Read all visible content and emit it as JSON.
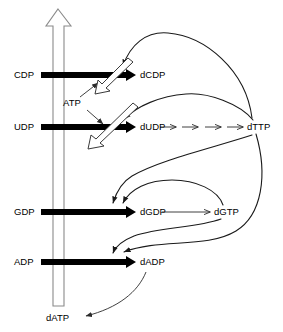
{
  "figure": {
    "type": "pathway-diagram"
  },
  "nodes": {
    "cdp": {
      "label": "CDP",
      "x": 14,
      "y": 75
    },
    "udp": {
      "label": "UDP",
      "x": 14,
      "y": 127
    },
    "gdp": {
      "label": "GDP",
      "x": 14,
      "y": 212
    },
    "adp": {
      "label": "ADP",
      "x": 14,
      "y": 262
    },
    "dcdp": {
      "label": "dCDP",
      "x": 140,
      "y": 75
    },
    "dudp": {
      "label": "dUDP",
      "x": 140,
      "y": 127
    },
    "dgdp": {
      "label": "dGDP",
      "x": 140,
      "y": 212
    },
    "dadp": {
      "label": "dADP",
      "x": 140,
      "y": 262
    },
    "dttp": {
      "label": "dTTP",
      "x": 255,
      "y": 127
    },
    "dgtp": {
      "label": "dGTP",
      "x": 222,
      "y": 212
    },
    "datp": {
      "label": "dATP",
      "x": 60,
      "y": 318
    },
    "atp": {
      "label": "ATP",
      "x": 83,
      "y": 103
    }
  },
  "reactions": [
    {
      "name": "cdp-to-dcdp",
      "from": "CDP",
      "to": "dCDP",
      "style": "thick-arrow"
    },
    {
      "name": "udp-to-dudp",
      "from": "UDP",
      "to": "dUDP",
      "style": "thick-arrow"
    },
    {
      "name": "gdp-to-dgdp",
      "from": "GDP",
      "to": "dGDP",
      "style": "thick-arrow"
    },
    {
      "name": "adp-to-dadp",
      "from": "ADP",
      "to": "dADP",
      "style": "thick-arrow"
    },
    {
      "name": "dudp-to-dttp",
      "from": "dUDP",
      "to": "dTTP",
      "style": "dashed-multistep-arrow",
      "steps": 4
    },
    {
      "name": "dgdp-to-dgtp",
      "from": "dGDP",
      "to": "dGTP",
      "style": "thin-arrow"
    },
    {
      "name": "dadp-to-datp",
      "from": "dADP",
      "to": "dATP",
      "style": "thin-curved-arrow"
    }
  ],
  "regulation": [
    {
      "name": "dttp-activates-cdp",
      "effector": "dTTP",
      "target": "CDP reduction",
      "sign": "positive"
    },
    {
      "name": "dttp-activates-udp",
      "effector": "dTTP",
      "target": "UDP reduction",
      "sign": "positive"
    },
    {
      "name": "dttp-activates-gdp",
      "effector": "dTTP",
      "target": "GDP reduction",
      "sign": "positive"
    },
    {
      "name": "dgtp-activates-gdp",
      "effector": "dGTP",
      "target": "GDP reduction",
      "sign": "positive"
    },
    {
      "name": "dttp-activates-adp",
      "effector": "dTTP",
      "target": "ADP reduction",
      "sign": "positive"
    },
    {
      "name": "dgtp-activates-adp",
      "effector": "dGTP",
      "target": "ADP reduction",
      "sign": "positive"
    },
    {
      "name": "atp-activates-cdp",
      "effector": "ATP",
      "target": "CDP reduction",
      "sign": "positive"
    },
    {
      "name": "atp-activates-udp",
      "effector": "ATP",
      "target": "UDP reduction",
      "sign": "positive"
    },
    {
      "name": "datp-inhibits-all",
      "effector": "dATP",
      "target": "all reductions",
      "sign": "negative"
    }
  ],
  "legend": {
    "hollow_arrow_meaning": "dATP inhibition of all four reductions",
    "open_arrowhead_meaning": "ATP stimulation"
  }
}
